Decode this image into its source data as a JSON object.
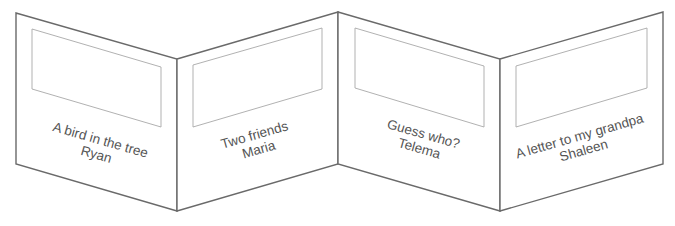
{
  "diagram": {
    "type": "zigzag-folded-book",
    "panels": [
      {
        "title": "A bird in the tree",
        "author": "Ryan"
      },
      {
        "title": "Two friends",
        "author": "Maria"
      },
      {
        "title": "Guess who?",
        "author": "Telema"
      },
      {
        "title": "A letter to my grandpa",
        "author": "Shaleen"
      }
    ],
    "colors": {
      "outline": "#6a6a6a",
      "frame": "#a8a8a8",
      "text": "#555555",
      "background": "#ffffff"
    }
  }
}
